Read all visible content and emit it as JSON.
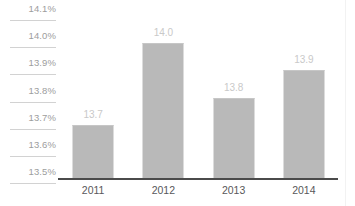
{
  "chart_data": {
    "type": "bar",
    "title": "",
    "subtitle": "",
    "xlabel": "",
    "ylabel": "",
    "categories": [
      "2011",
      "2012",
      "2013",
      "2014"
    ],
    "values": [
      13.7,
      14.0,
      13.8,
      13.9
    ],
    "value_labels": [
      "13.7",
      "14.0",
      "13.8",
      "13.9"
    ],
    "ylim": [
      13.5,
      14.1
    ],
    "ytick_values": [
      14.1,
      14.0,
      13.9,
      13.8,
      13.7,
      13.6,
      13.5
    ],
    "ytick_labels": [
      "14.1%",
      "14.0%",
      "13.9%",
      "13.8%",
      "13.7%",
      "13.6%",
      "13.5%"
    ],
    "grid": "y-tick-rules-only",
    "legend": "none",
    "series": [
      {
        "name": "",
        "values": [
          13.7,
          14.0,
          13.8,
          13.9
        ]
      }
    ]
  },
  "style": {
    "bar_color": "#b9b9b9",
    "value_label_color": "#c9c9c9",
    "ytick_label_color": "#9d9d9d",
    "xtick_label_color": "#58585a",
    "axis_line_color": "#4b4b4b",
    "gridline_color": "#d2d2d2",
    "background_color": "#ffffff"
  }
}
